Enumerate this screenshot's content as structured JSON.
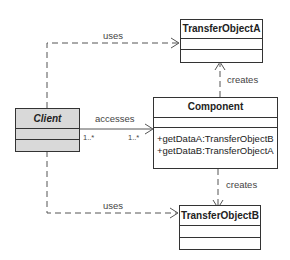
{
  "diagram": {
    "type": "UML class diagram",
    "classes": {
      "client": {
        "name": "Client",
        "abstract": true,
        "fill": "#d9d9d9"
      },
      "transfer_a": {
        "name": "TransferObjectA"
      },
      "transfer_b": {
        "name": "TransferObjectB"
      },
      "component": {
        "name": "Component",
        "operations": [
          "+getDataA:TransferObjectB",
          "+getDataB:TransferObjectA"
        ]
      }
    },
    "relations": {
      "uses_a": {
        "label": "uses",
        "from": "Client",
        "to": "TransferObjectA",
        "style": "dashed-dependency"
      },
      "uses_b": {
        "label": "uses",
        "from": "Client",
        "to": "TransferObjectB",
        "style": "dashed-dependency"
      },
      "accesses": {
        "label": "accesses",
        "from": "Client",
        "to": "Component",
        "style": "association",
        "mult_from": "1..*",
        "mult_to": "1..*"
      },
      "creates_a": {
        "label": "creates",
        "from": "Component",
        "to": "TransferObjectA",
        "style": "dashed-dependency"
      },
      "creates_b": {
        "label": "creates",
        "from": "Component",
        "to": "TransferObjectB",
        "style": "dashed-dependency"
      }
    }
  }
}
